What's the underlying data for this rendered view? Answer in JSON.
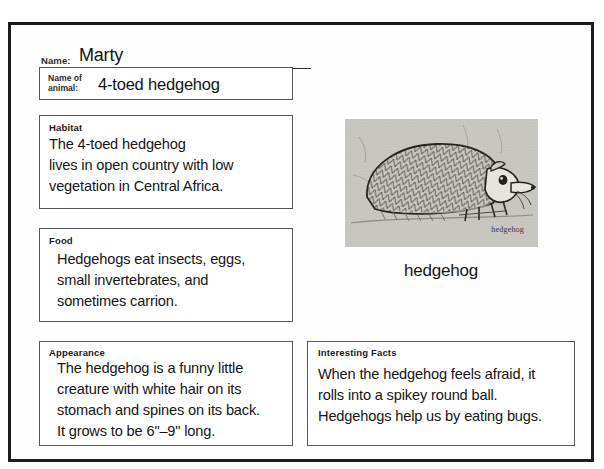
{
  "worksheet": {
    "name_field": {
      "label": "Name:",
      "value": "Marty"
    },
    "animal_field": {
      "label": "Name of\nanimal:",
      "value": "4-toed hedgehog"
    },
    "sections": {
      "habitat": {
        "title": "Habitat",
        "body": "The 4-toed hedgehog\nlives in open country with low\nvegetation in Central Africa."
      },
      "food": {
        "title": "Food",
        "body": "Hedgehogs eat insects, eggs,\nsmall invertebrates, and\nsometimes carrion."
      },
      "appearance": {
        "title": "Appearance",
        "body": "The hedgehog is a funny little\ncreature with white hair on its\nstomach and spines on its back.\nIt grows to be 6\"–9\" long."
      },
      "interesting_facts": {
        "title": "Interesting Facts",
        "body": "When the hedgehog feels afraid, it\nrolls into a spikey round ball.\nHedgehogs help us by eating bugs."
      }
    },
    "illustration": {
      "inner_caption": "hedgehog",
      "caption": "hedgehog",
      "alt_name": "hedgehog-drawing"
    },
    "colors": {
      "page_border": "#1c1c1c",
      "box_border": "#53565c",
      "text": "#151515",
      "photo_background": "#c9c7c2"
    }
  }
}
